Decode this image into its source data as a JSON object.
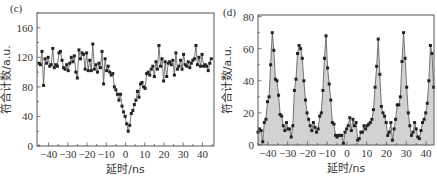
{
  "chart_data": [
    {
      "panel_label": "(c)",
      "type": "line",
      "xlabel": "延时/ns",
      "ylabel": "符合计数/a.u.",
      "xlim": [
        -46,
        46
      ],
      "ylim": [
        0,
        180
      ],
      "xticks": [
        -40,
        -30,
        -20,
        -10,
        0,
        10,
        20,
        30,
        40
      ],
      "yticks": [
        0,
        40,
        80,
        120,
        160
      ],
      "grid": false,
      "fill": false,
      "markers": true,
      "x": [
        -45,
        -44.2,
        -43.4,
        -42.6,
        -41.8,
        -41,
        -40.2,
        -39.4,
        -38.6,
        -37.8,
        -37,
        -36.2,
        -35.4,
        -34.6,
        -33.8,
        -33,
        -32.2,
        -31.4,
        -30.6,
        -29.8,
        -29,
        -28.2,
        -27.4,
        -26.6,
        -25.8,
        -25,
        -24.2,
        -23.4,
        -22.6,
        -21.8,
        -21,
        -20.2,
        -19.4,
        -18.6,
        -17.8,
        -17,
        -16.2,
        -15.4,
        -14.6,
        -13.8,
        -13,
        -12.2,
        -11.4,
        -10.6,
        -9.8,
        -9,
        -8.2,
        -7.4,
        -6.6,
        -5.8,
        -5,
        -4.2,
        -3.4,
        -2.6,
        -1.8,
        -1,
        -0.2,
        0.6,
        1.4,
        2.2,
        3,
        3.8,
        4.6,
        5.4,
        6.2,
        7,
        7.8,
        8.6,
        9.4,
        10.2,
        11,
        11.8,
        12.6,
        13.4,
        14.2,
        15,
        15.8,
        16.6,
        17.4,
        18.2,
        19,
        19.8,
        20.6,
        21.4,
        22.2,
        23,
        23.8,
        24.6,
        25.4,
        26.2,
        27,
        27.8,
        28.6,
        29.4,
        30.2,
        31,
        31.8,
        32.6,
        33.4,
        34.2,
        35,
        35.8,
        36.6,
        37.4,
        38.2,
        39,
        39.8,
        40.6,
        41.4,
        42.2,
        43,
        43.8,
        44.6
      ],
      "values": [
        112,
        110,
        128,
        82,
        118,
        112,
        120,
        108,
        110,
        132,
        106,
        110,
        108,
        126,
        128,
        116,
        106,
        104,
        110,
        102,
        112,
        120,
        114,
        122,
        100,
        92,
        130,
        118,
        126,
        124,
        104,
        126,
        102,
        116,
        102,
        138,
        104,
        110,
        100,
        112,
        106,
        128,
        84,
        118,
        102,
        108,
        100,
        96,
        98,
        80,
        76,
        70,
        62,
        70,
        54,
        46,
        40,
        30,
        20,
        28,
        44,
        48,
        56,
        62,
        74,
        66,
        84,
        86,
        80,
        78,
        98,
        100,
        96,
        104,
        108,
        94,
        114,
        104,
        136,
        108,
        118,
        88,
        114,
        94,
        112,
        114,
        110,
        116,
        96,
        126,
        104,
        108,
        116,
        104,
        124,
        110,
        108,
        114,
        106,
        112,
        116,
        118,
        136,
        110,
        120,
        108,
        124,
        108,
        110,
        108,
        102,
        112,
        118,
        120,
        110,
        104,
        120
      ]
    },
    {
      "panel_label": "(d)",
      "type": "area",
      "xlabel": "延时/ns",
      "ylabel": "符合计数/a.u.",
      "xlim": [
        -45,
        44
      ],
      "ylim": [
        0,
        81
      ],
      "xticks": [
        -40,
        -30,
        -20,
        -10,
        0,
        10,
        20,
        30,
        40
      ],
      "yticks": [
        0,
        20,
        40,
        60,
        80
      ],
      "grid": false,
      "fill": true,
      "markers": true,
      "peak_centers": [
        -38,
        -25.5,
        -13,
        12.5,
        25,
        37
      ],
      "peak_heights": [
        70,
        62,
        68,
        66,
        70,
        63
      ],
      "x": [
        -45,
        -44.2,
        -43.4,
        -42.6,
        -41.8,
        -41,
        -40.2,
        -39.4,
        -38.6,
        -37.8,
        -37,
        -36.2,
        -35.4,
        -34.6,
        -33.8,
        -33,
        -32.2,
        -31.4,
        -30.6,
        -29.8,
        -29,
        -28.2,
        -27.4,
        -26.6,
        -25.8,
        -25,
        -24.2,
        -23.4,
        -22.6,
        -21.8,
        -21,
        -20.2,
        -19.4,
        -18.6,
        -17.8,
        -17,
        -16.2,
        -15.4,
        -14.6,
        -13.8,
        -13,
        -12.2,
        -11.4,
        -10.6,
        -9.8,
        -9,
        -8.2,
        -7.4,
        -6.6,
        -5.8,
        -5,
        -4.2,
        -3.4,
        -2.6,
        -1.8,
        -1,
        -0.2,
        0.6,
        1.4,
        2.2,
        3,
        3.8,
        4.6,
        5.4,
        6.2,
        7,
        7.8,
        8.6,
        9.4,
        10.2,
        11,
        11.8,
        12.6,
        13.4,
        14.2,
        15,
        15.8,
        16.6,
        17.4,
        18.2,
        19,
        19.8,
        20.6,
        21.4,
        22.2,
        23,
        23.8,
        24.6,
        25.4,
        26.2,
        27,
        27.8,
        28.6,
        29.4,
        30.2,
        31,
        31.8,
        32.6,
        33.4,
        34.2,
        35,
        35.8,
        36.6,
        37.4,
        38.2,
        39,
        39.8,
        40.6,
        41.4,
        42.2,
        43,
        43.8
      ],
      "values": [
        8,
        10,
        9,
        2,
        14,
        16,
        27,
        30,
        50,
        70,
        59,
        41,
        40,
        31,
        19,
        18,
        12,
        9,
        14,
        10,
        10,
        5,
        12,
        34,
        41,
        57,
        62,
        60,
        54,
        40,
        28,
        20,
        16,
        12,
        9,
        14,
        11,
        8,
        10,
        18,
        20,
        34,
        54,
        68,
        48,
        38,
        28,
        14,
        13,
        6,
        5,
        6,
        6,
        6,
        1,
        8,
        10,
        12,
        17,
        9,
        16,
        12,
        14,
        3,
        4,
        8,
        8,
        12,
        10,
        12,
        13,
        14,
        16,
        22,
        36,
        49,
        66,
        44,
        24,
        20,
        18,
        14,
        6,
        8,
        14,
        3,
        10,
        16,
        25,
        25,
        30,
        52,
        70,
        54,
        36,
        20,
        12,
        6,
        8,
        14,
        10,
        5,
        4,
        9,
        14,
        16,
        20,
        26,
        40,
        62,
        57,
        36,
        24,
        14,
        6,
        8,
        10
      ]
    }
  ]
}
